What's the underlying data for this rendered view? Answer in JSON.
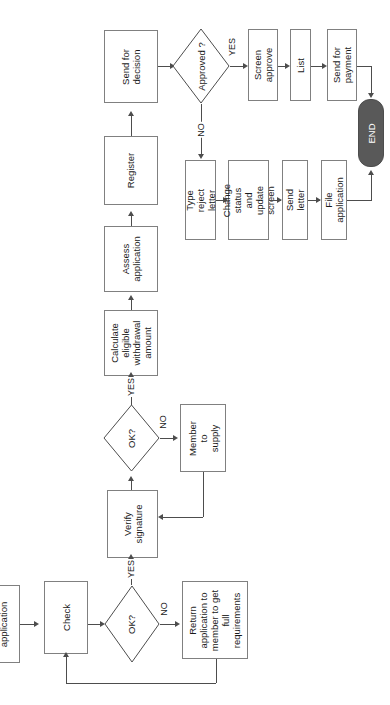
{
  "diagram": {
    "orientation": "rotated-90-ccw",
    "colors": {
      "node_fill": "#ffffff",
      "node_stroke": "#808080",
      "line": "#4d4d4d",
      "terminator_fill": "#595959",
      "terminator_text": "#ffffff",
      "text": "#1a1a1a"
    },
    "nodes": {
      "application": "application",
      "check": "Check",
      "ok1": "OK?",
      "return_application": "Return\napplication to\nmember to get\nfull\nrequirements",
      "verify_signature": "Verify\nsignature",
      "ok2": "OK?",
      "member_to_supply": "Member to\nsupply",
      "calculate": "Calculate\neligible\nwithdrawal\namount",
      "assess": "Assess\napplication",
      "register": "Register",
      "send_for_decision": "Send for\ndecision",
      "approved": "Approved\n?",
      "screen_approve": "Screen\napprove",
      "list": "List",
      "send_for_payment": "Send for\npayment",
      "type_reject_letter": "Type reject\nletter",
      "change_status": "Change status\nand update\nscreen",
      "send_letter": "Send letter",
      "file_application": "File application",
      "end": "END"
    },
    "edge_labels": {
      "ok1_yes": "YES",
      "ok1_no": "NO",
      "ok2_yes": "YES",
      "ok2_no": "NO",
      "approved_yes": "YES",
      "approved_no": "NO"
    }
  }
}
